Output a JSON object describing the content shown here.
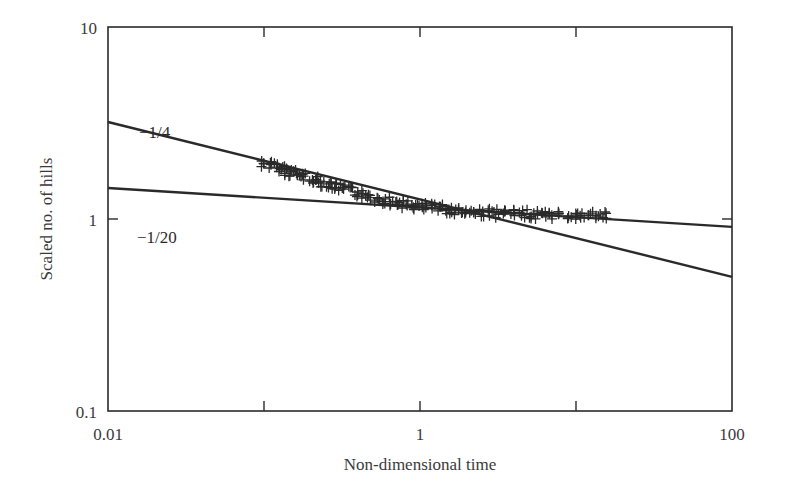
{
  "chart_data": {
    "type": "scatter",
    "title": "",
    "xlabel": "Non-dimensional time",
    "ylabel": "Scaled no. of hills",
    "xscale": "log",
    "yscale": "log",
    "xlim": [
      0.01,
      100
    ],
    "ylim": [
      0.1,
      10
    ],
    "grid": false,
    "legend": null,
    "x_ticks": [
      {
        "value": 0.01,
        "label": "0.01"
      },
      {
        "value": 0.1,
        "label": ""
      },
      {
        "value": 1,
        "label": "1"
      },
      {
        "value": 10,
        "label": ""
      },
      {
        "value": 100,
        "label": "100"
      }
    ],
    "y_ticks": [
      {
        "value": 0.1,
        "label": "0.1"
      },
      {
        "value": 1,
        "label": "1"
      },
      {
        "value": 10,
        "label": "10"
      }
    ],
    "series": [
      {
        "name": "simulation data",
        "marker": "+",
        "color": "#2a2a2a",
        "x": [
          0.1,
          0.11,
          0.12,
          0.13,
          0.14,
          0.15,
          0.16,
          0.17,
          0.18,
          0.2,
          0.22,
          0.24,
          0.26,
          0.28,
          0.3,
          0.33,
          0.36,
          0.4,
          0.44,
          0.48,
          0.53,
          0.58,
          0.64,
          0.7,
          0.77,
          0.85,
          0.93,
          1.0,
          1.1,
          1.2,
          1.35,
          1.5,
          1.65,
          1.8,
          2.0,
          2.2,
          2.5,
          2.8,
          3.1,
          3.5,
          4.0,
          4.5,
          5.0,
          5.6,
          6.3,
          7.0,
          8.0,
          9.0,
          10.0,
          11.0,
          12.5,
          14.0,
          15.0
        ],
        "y": [
          1.95,
          1.9,
          1.86,
          1.82,
          1.78,
          1.75,
          1.72,
          1.69,
          1.66,
          1.62,
          1.58,
          1.55,
          1.52,
          1.49,
          1.46,
          1.43,
          1.4,
          1.37,
          1.34,
          1.31,
          1.28,
          1.26,
          1.24,
          1.22,
          1.2,
          1.18,
          1.17,
          1.16,
          1.15,
          1.14,
          1.13,
          1.12,
          1.11,
          1.1,
          1.09,
          1.09,
          1.08,
          1.08,
          1.07,
          1.07,
          1.06,
          1.06,
          1.06,
          1.05,
          1.05,
          1.05,
          1.05,
          1.04,
          1.04,
          1.04,
          1.04,
          1.04,
          1.04
        ]
      },
      {
        "name": "-1/4",
        "type": "line",
        "color": "#2a2a2a",
        "x": [
          0.01,
          100
        ],
        "y": [
          3.2,
          0.5
        ]
      },
      {
        "name": "-1/20",
        "type": "line",
        "color": "#2a2a2a",
        "x": [
          0.01,
          100
        ],
        "y": [
          1.45,
          0.91
        ]
      }
    ],
    "annotations": [
      {
        "text": "−1/4",
        "x": 0.018,
        "y": 4.2
      },
      {
        "text": "−1/20",
        "x": 0.018,
        "y": 0.85
      }
    ]
  }
}
